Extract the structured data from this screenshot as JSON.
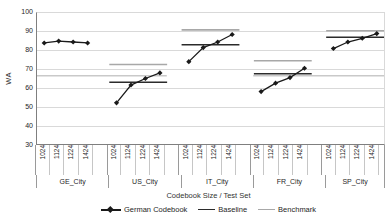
{
  "chart_data": {
    "type": "line",
    "title": "",
    "ylabel": "WA",
    "xlabel": "Codebook Size / Test Set",
    "ylim": [
      30,
      100
    ],
    "y_ticks": [
      100,
      90,
      80,
      70,
      60,
      50,
      40,
      30
    ],
    "grid": true,
    "legend_position": "bottom",
    "tick_labels": [
      "1024",
      "1124",
      "1224",
      "1424"
    ],
    "groups": [
      {
        "label": "GE_City",
        "series": [
          84,
          85,
          84.5,
          84
        ],
        "baseline": null,
        "benchmark": null
      },
      {
        "label": "US_City",
        "series": [
          52,
          61.5,
          65,
          68
        ],
        "baseline": 63,
        "benchmark": 72.5
      },
      {
        "label": "IT_City",
        "series": [
          74,
          81.5,
          84.5,
          88.5
        ],
        "baseline": 83,
        "benchmark": 91
      },
      {
        "label": "FR_City",
        "series": [
          58,
          62.5,
          65.5,
          70.5
        ],
        "baseline": 67.5,
        "benchmark": 74.5
      },
      {
        "label": "SP_City",
        "series": [
          81,
          84.5,
          86.5,
          89
        ],
        "baseline": 87,
        "benchmark": 90.5
      }
    ],
    "reference_line": {
      "name": "benchmark-reference",
      "value": 66.5,
      "segments": [
        [
          0,
          0.374
        ],
        [
          0.623,
          1.0
        ]
      ]
    },
    "legend": [
      {
        "label": "German Codebook",
        "marker": "diamond-line",
        "color": "#1a1a1a"
      },
      {
        "label": "Baseline",
        "marker": "line",
        "color": "#2b2b2b"
      },
      {
        "label": "Benchmark",
        "marker": "line",
        "color": "#a8a8a8"
      }
    ],
    "colors": {
      "series": "#1a1a1a",
      "baseline": "#2b2b2b",
      "benchmark": "#a8a8a8",
      "grid": "#d9d9d9",
      "reference": "#c9c9c9"
    }
  }
}
